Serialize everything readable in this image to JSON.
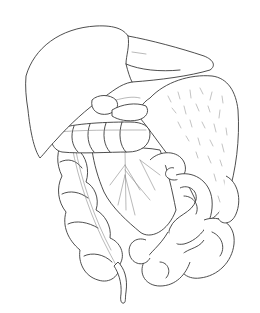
{
  "illustration": {
    "subject": "abdominal organs line drawing",
    "background": "#ffffff",
    "stroke_color": "#3a3a3a",
    "organs": [
      {
        "id": "liver",
        "name": "liver"
      },
      {
        "id": "gallbladder",
        "name": "gallbladder"
      },
      {
        "id": "stomach",
        "name": "stomach"
      },
      {
        "id": "transverse-colon",
        "name": "transverse colon"
      },
      {
        "id": "ascending-colon",
        "name": "ascending colon"
      },
      {
        "id": "mesentery",
        "name": "mesentery"
      },
      {
        "id": "small-intestine",
        "name": "small intestine"
      },
      {
        "id": "appendix",
        "name": "appendix"
      }
    ]
  }
}
